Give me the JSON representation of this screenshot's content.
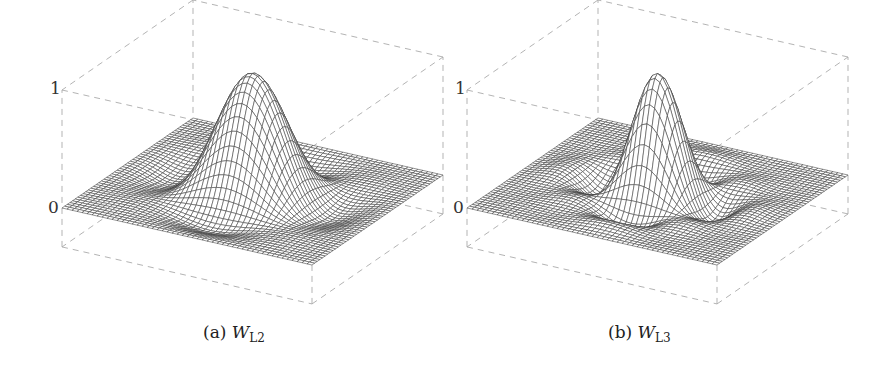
{
  "figure": {
    "panels": [
      {
        "id": "a",
        "caption_label": "(a)",
        "caption_symbol": "W",
        "caption_subscript": "L2",
        "z_ticks": [
          "1",
          "0"
        ],
        "kernel": "lanczos",
        "lobes": 2
      },
      {
        "id": "b",
        "caption_label": "(b)",
        "caption_symbol": "W",
        "caption_subscript": "L3",
        "z_ticks": [
          "1",
          "0"
        ],
        "kernel": "lanczos",
        "lobes": 3
      }
    ],
    "colors": {
      "mesh": "#3a3a3a",
      "box": "#aaaaaa",
      "text": "#222222"
    }
  }
}
